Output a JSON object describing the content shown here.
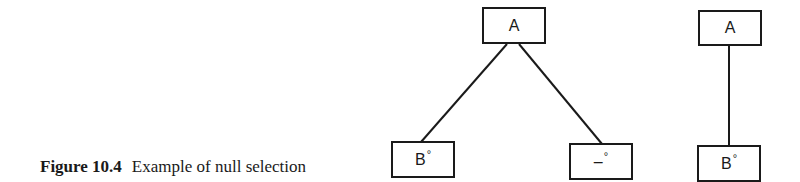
{
  "caption": {
    "figure_number": "Figure 10.4",
    "text": "Example of null selection"
  },
  "trees": [
    {
      "root": {
        "label": "A",
        "superscript": ""
      },
      "children": [
        {
          "label": "B",
          "superscript": "°"
        },
        {
          "label": "–",
          "superscript": "°"
        }
      ]
    },
    {
      "root": {
        "label": "A",
        "superscript": ""
      },
      "children": [
        {
          "label": "B",
          "superscript": "°"
        }
      ]
    }
  ],
  "colors": {
    "ink": "#1a1a1a",
    "background": "#ffffff"
  }
}
